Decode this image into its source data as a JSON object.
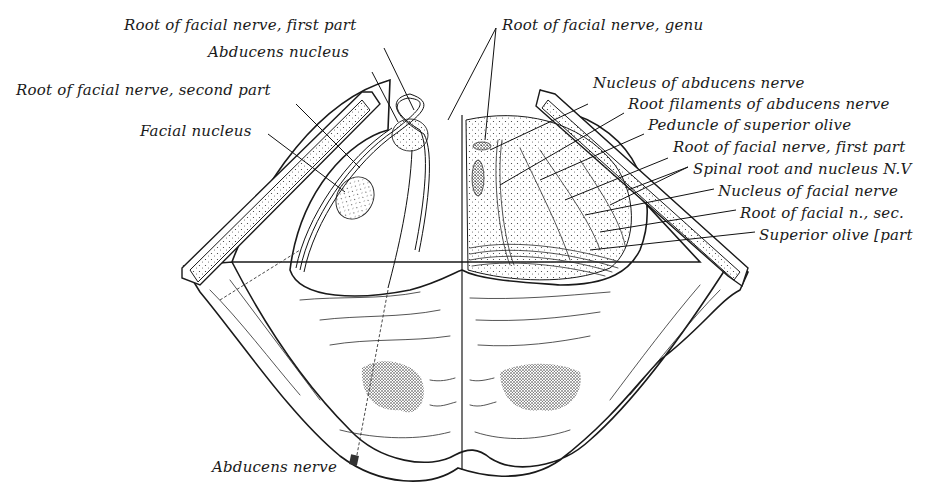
{
  "figure": {
    "type": "anatomical line drawing",
    "colors": {
      "ink": "#1a1a1a",
      "background": "#ffffff"
    }
  },
  "labels_left": [
    {
      "id": "root-facial-first-left",
      "text": "Root of facial nerve, first part",
      "x": 124,
      "y": 28
    },
    {
      "id": "abducens-nucleus",
      "text": "Abducens nucleus",
      "x": 208,
      "y": 55
    },
    {
      "id": "root-facial-second",
      "text": "Root of facial nerve, second part",
      "x": 16,
      "y": 93
    },
    {
      "id": "facial-nucleus",
      "text": "Facial nucleus",
      "x": 140,
      "y": 123
    },
    {
      "id": "abducens-nerve",
      "text": "Abducens nerve",
      "x": 212,
      "y": 458
    }
  ],
  "labels_right": [
    {
      "id": "root-facial-genu",
      "text": "Root of facial nerve, genu",
      "x": 502,
      "y": 20
    },
    {
      "id": "nucleus-abducens-nerve",
      "text": "Nucleus of abducens nerve",
      "x": 593,
      "y": 74
    },
    {
      "id": "root-filaments-abducens",
      "text": "Root filaments of abducens nerve",
      "x": 628,
      "y": 97
    },
    {
      "id": "peduncle-superior-olive",
      "text": "Peduncle of superior olive",
      "x": 648,
      "y": 119
    },
    {
      "id": "root-facial-first-right",
      "text": "Root of facial nerve, first part",
      "x": 673,
      "y": 142
    },
    {
      "id": "spinal-root-nucleus-nv",
      "text": "Spinal root and nucleus N.V",
      "x": 693,
      "y": 164
    },
    {
      "id": "nucleus-facial-nerve",
      "text": "Nucleus of facial nerve",
      "x": 718,
      "y": 186
    },
    {
      "id": "root-facial-sec",
      "text": "Root of facial n., sec.",
      "x": 740,
      "y": 208
    },
    {
      "id": "superior-olive",
      "text": "Superior olive  [part",
      "x": 759,
      "y": 230
    }
  ]
}
